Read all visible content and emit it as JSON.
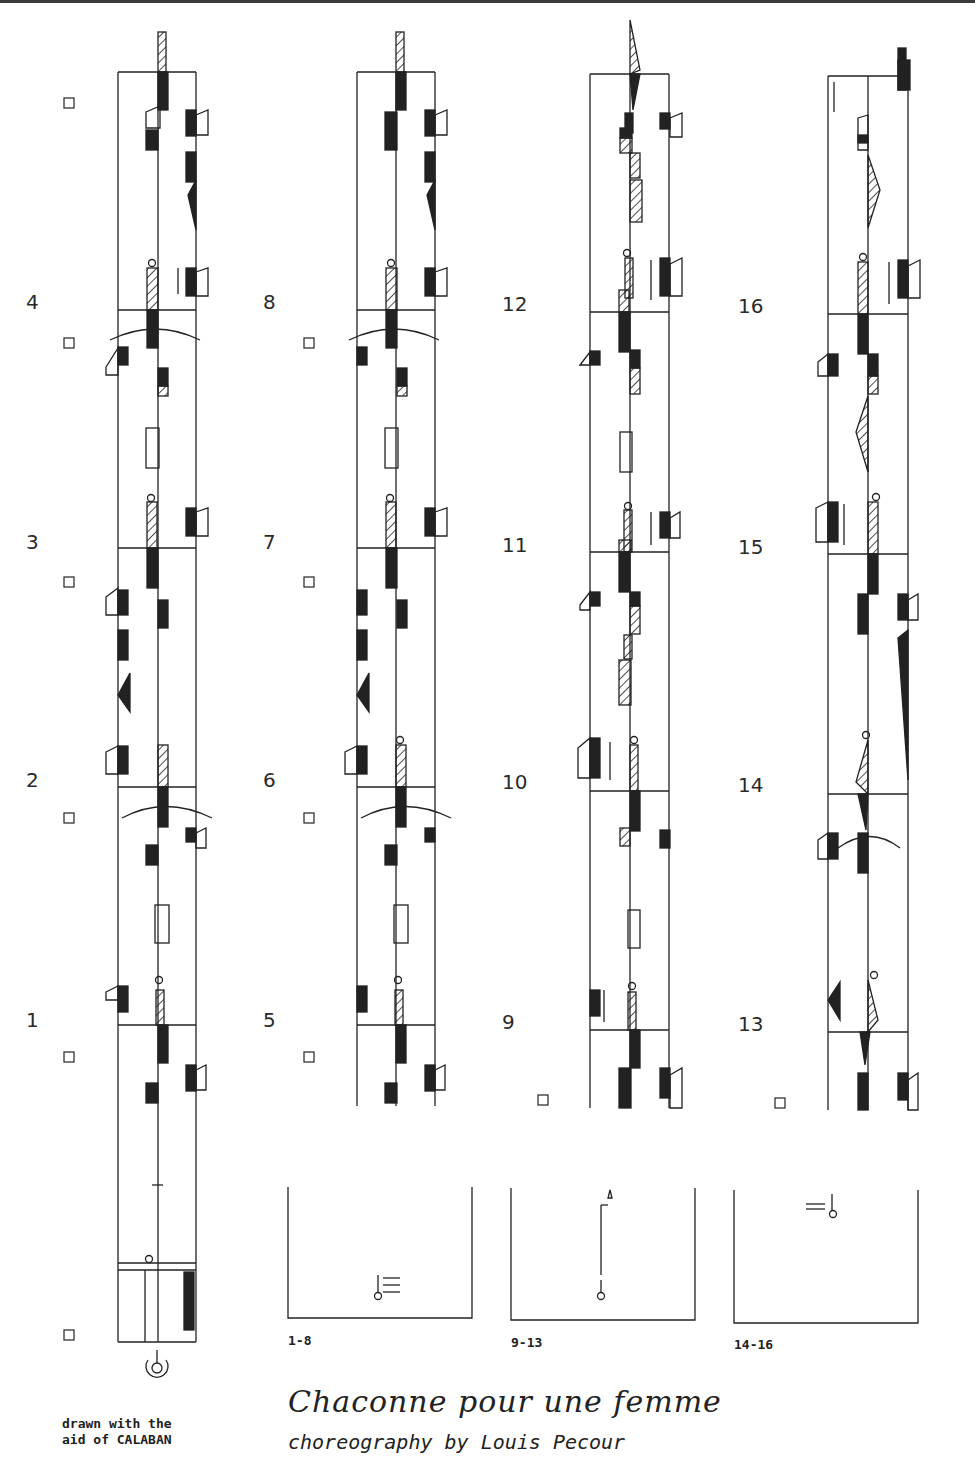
{
  "document": {
    "title": "Chaconne pour une femme",
    "subtitle": "choreography by Louis Pecour",
    "credit_line1": "drawn with the",
    "credit_line2": "aid of CALABAN",
    "notation_type": "Labanotation score"
  },
  "staves": [
    {
      "id": "staff-1",
      "measures": [
        "1",
        "2",
        "3",
        "4"
      ],
      "measure_labels": [
        {
          "text": "1",
          "y": 1008
        },
        {
          "text": "2",
          "y": 768
        },
        {
          "text": "3",
          "y": 530
        },
        {
          "text": "4",
          "y": 290
        }
      ]
    },
    {
      "id": "staff-2",
      "measures": [
        "5",
        "6",
        "7",
        "8"
      ],
      "measure_labels": [
        {
          "text": "5",
          "y": 1008
        },
        {
          "text": "6",
          "y": 768
        },
        {
          "text": "7",
          "y": 530
        },
        {
          "text": "8",
          "y": 290
        }
      ]
    },
    {
      "id": "staff-3",
      "measures": [
        "9",
        "10",
        "11",
        "12"
      ],
      "measure_labels": [
        {
          "text": "9",
          "y": 1010
        },
        {
          "text": "10",
          "y": 770
        },
        {
          "text": "11",
          "y": 533
        },
        {
          "text": "12",
          "y": 292
        }
      ]
    },
    {
      "id": "staff-4",
      "measures": [
        "13",
        "14",
        "15",
        "16"
      ],
      "measure_labels": [
        {
          "text": "13",
          "y": 1012
        },
        {
          "text": "14",
          "y": 773
        },
        {
          "text": "15",
          "y": 535
        },
        {
          "text": "16",
          "y": 294
        }
      ]
    }
  ],
  "floor_plans": [
    {
      "label": "1-8"
    },
    {
      "label": "9-13"
    },
    {
      "label": "14-16"
    }
  ]
}
